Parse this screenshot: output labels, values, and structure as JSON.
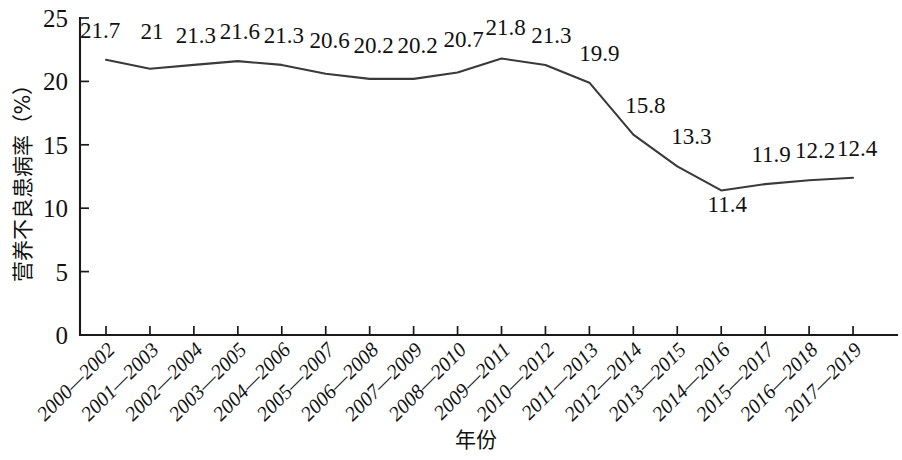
{
  "chart_data": {
    "type": "line",
    "title": "",
    "xlabel": "年份",
    "ylabel": "营养不良患病率（%）",
    "categories": [
      "2000—2002",
      "2001—2003",
      "2002—2004",
      "2003—2005",
      "2004—2006",
      "2005—2007",
      "2006—2008",
      "2007—2009",
      "2008—2010",
      "2009—2011",
      "2010—2012",
      "2011—2013",
      "2012—2014",
      "2013—2015",
      "2014—2016",
      "2015—2017",
      "2016—2018",
      "2017—2019"
    ],
    "values": [
      21.7,
      21,
      21.3,
      21.6,
      21.3,
      20.6,
      20.2,
      20.2,
      20.7,
      21.8,
      21.3,
      19.9,
      15.8,
      13.3,
      11.4,
      11.9,
      12.2,
      12.4
    ],
    "value_labels": [
      "21.7",
      "21",
      "21.3",
      "21.6",
      "21.3",
      "20.6",
      "20.2",
      "20.2",
      "20.7",
      "21.8",
      "21.3",
      "19.9",
      "15.8",
      "13.3",
      "11.4",
      "11.9",
      "12.2",
      "12.4"
    ],
    "ylim": [
      0,
      25
    ],
    "yticks": [
      0,
      5,
      10,
      15,
      20,
      25
    ],
    "ytick_labels": [
      "0",
      "5",
      "10",
      "15",
      "20",
      "25"
    ],
    "grid": false,
    "legend": null,
    "series": [
      {
        "name": "营养不良患病率",
        "color": "#3a3a3a",
        "values": [
          21.7,
          21,
          21.3,
          21.6,
          21.3,
          20.6,
          20.2,
          20.2,
          20.7,
          21.8,
          21.3,
          19.9,
          15.8,
          13.3,
          11.4,
          11.9,
          12.2,
          12.4
        ]
      }
    ]
  },
  "colors": {
    "line": "#3a3a3a",
    "axis": "#1a1a1a",
    "text": "#111111",
    "background": "#ffffff"
  }
}
